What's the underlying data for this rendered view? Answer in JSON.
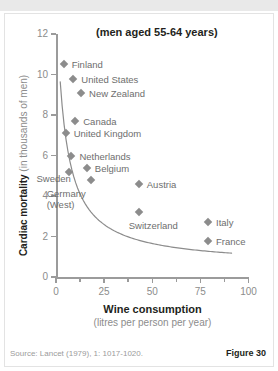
{
  "topbar": {
    "ghost_text": ""
  },
  "chart_data": {
    "type": "scatter",
    "title": "(men aged 55-64 years)",
    "xlabel": "Wine consumption",
    "xlabel_sub": "(litres per person per year)",
    "ylabel": "Cardiac mortality",
    "ylabel_sub": "(in thousands of men)",
    "xlim": [
      0,
      100
    ],
    "ylim": [
      0,
      12
    ],
    "xticks": [
      0,
      25,
      50,
      75,
      100
    ],
    "yticks": [
      0,
      2,
      4,
      6,
      8,
      10,
      12
    ],
    "grid": false,
    "legend": "none",
    "marker_shape": "diamond",
    "marker_color": "#8c8c8c",
    "curve_color": "#8c8c8c",
    "curve_note": "fitted inverse/hyperbolic trend line through points",
    "points": [
      {
        "label": "Finland",
        "x": 4,
        "y": 10.5,
        "label_dx": 8,
        "label_dy": -5
      },
      {
        "label": "United States",
        "x": 9,
        "y": 9.8,
        "label_dx": 8,
        "label_dy": -5
      },
      {
        "label": "New Zealand",
        "x": 13,
        "y": 9.1,
        "label_dx": 8,
        "label_dy": -5
      },
      {
        "label": "Canada",
        "x": 10,
        "y": 7.7,
        "label_dx": 8,
        "label_dy": -5
      },
      {
        "label": "United Kingdom",
        "x": 5,
        "y": 7.1,
        "label_dx": 8,
        "label_dy": -5
      },
      {
        "label": "Netherlands",
        "x": 8,
        "y": 6.0,
        "label_dx": 8,
        "label_dy": -5
      },
      {
        "label": "Belgium",
        "x": 16,
        "y": 5.4,
        "label_dx": 8,
        "label_dy": -5
      },
      {
        "label": "Sweden",
        "x": 7,
        "y": 5.2,
        "label_dx": -33,
        "label_dy": 1
      },
      {
        "label": "Germany (West)",
        "x": 18,
        "y": 4.8,
        "label_dx": -44,
        "label_dy": 8
      },
      {
        "label": "Austria",
        "x": 43,
        "y": 4.6,
        "label_dx": 8,
        "label_dy": -5
      },
      {
        "label": "Switzerland",
        "x": 43,
        "y": 3.2,
        "label_dx": -10,
        "label_dy": 8
      },
      {
        "label": "Italy",
        "x": 79,
        "y": 2.7,
        "label_dx": 8,
        "label_dy": -5
      },
      {
        "label": "France",
        "x": 79,
        "y": 1.8,
        "label_dx": 8,
        "label_dy": -5
      }
    ]
  },
  "footer": {
    "source": "Source: Lancet (1979), 1: 1017-1020.",
    "figure": "Figure 30"
  }
}
